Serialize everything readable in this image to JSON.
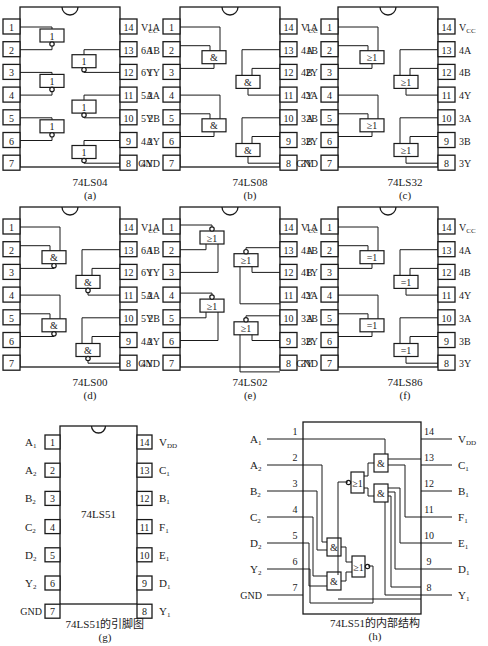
{
  "chips": [
    {
      "id": "a",
      "name": "74LS04",
      "caption": "(a)",
      "gate_type": "NOT",
      "gate_symbol": "1",
      "left_pins": [
        {
          "num": "1",
          "label": "1A"
        },
        {
          "num": "2",
          "label": "1Y"
        },
        {
          "num": "3",
          "label": "2A"
        },
        {
          "num": "4",
          "label": "2Y"
        },
        {
          "num": "5",
          "label": "3A"
        },
        {
          "num": "6",
          "label": "3Y"
        },
        {
          "num": "7",
          "label": "GND"
        }
      ],
      "right_pins": [
        {
          "num": "14",
          "label": "VCC"
        },
        {
          "num": "13",
          "label": "6A"
        },
        {
          "num": "12",
          "label": "6Y"
        },
        {
          "num": "11",
          "label": "5A"
        },
        {
          "num": "10",
          "label": "5Y"
        },
        {
          "num": "9",
          "label": "4A"
        },
        {
          "num": "8",
          "label": "4Y"
        }
      ]
    },
    {
      "id": "b",
      "name": "74LS08",
      "caption": "(b)",
      "gate_type": "AND",
      "gate_symbol": "&",
      "left_pins": [
        {
          "num": "1",
          "label": "1A"
        },
        {
          "num": "2",
          "label": "1B"
        },
        {
          "num": "3",
          "label": "1Y"
        },
        {
          "num": "4",
          "label": "2A"
        },
        {
          "num": "5",
          "label": "2B"
        },
        {
          "num": "6",
          "label": "2Y"
        },
        {
          "num": "7",
          "label": "GND"
        }
      ],
      "right_pins": [
        {
          "num": "14",
          "label": "VCC"
        },
        {
          "num": "13",
          "label": "4A"
        },
        {
          "num": "12",
          "label": "4B"
        },
        {
          "num": "11",
          "label": "4Y"
        },
        {
          "num": "10",
          "label": "3A"
        },
        {
          "num": "9",
          "label": "3B"
        },
        {
          "num": "8",
          "label": "3Y"
        }
      ]
    },
    {
      "id": "c",
      "name": "74LS32",
      "caption": "(c)",
      "gate_type": "OR",
      "gate_symbol": "≥1",
      "left_pins": [
        {
          "num": "1",
          "label": "1A"
        },
        {
          "num": "2",
          "label": "1B"
        },
        {
          "num": "3",
          "label": "2Y"
        },
        {
          "num": "4",
          "label": "2A"
        },
        {
          "num": "5",
          "label": "2B"
        },
        {
          "num": "6",
          "label": "2Y"
        },
        {
          "num": "7",
          "label": "GND"
        }
      ],
      "right_pins": [
        {
          "num": "14",
          "label": "VCC"
        },
        {
          "num": "13",
          "label": "4A"
        },
        {
          "num": "12",
          "label": "4B"
        },
        {
          "num": "11",
          "label": "4Y"
        },
        {
          "num": "10",
          "label": "3A"
        },
        {
          "num": "9",
          "label": "3B"
        },
        {
          "num": "8",
          "label": "3Y"
        }
      ]
    },
    {
      "id": "d",
      "name": "74LS00",
      "caption": "(d)",
      "gate_type": "NAND",
      "gate_symbol": "&",
      "left_pins": [
        {
          "num": "1",
          "label": "1A"
        },
        {
          "num": "2",
          "label": "1Y"
        },
        {
          "num": "3",
          "label": "2A"
        },
        {
          "num": "4",
          "label": "2Y"
        },
        {
          "num": "5",
          "label": "3A"
        },
        {
          "num": "6",
          "label": "3Y"
        },
        {
          "num": "7",
          "label": "GND"
        }
      ],
      "right_pins": [
        {
          "num": "14",
          "label": "VCC"
        },
        {
          "num": "13",
          "label": "6A"
        },
        {
          "num": "12",
          "label": "6Y"
        },
        {
          "num": "11",
          "label": "5A"
        },
        {
          "num": "10",
          "label": "5Y"
        },
        {
          "num": "9",
          "label": "4A"
        },
        {
          "num": "8",
          "label": "4Y"
        }
      ]
    },
    {
      "id": "e",
      "name": "74LS02",
      "caption": "(e)",
      "gate_type": "NOR",
      "gate_symbol": "≥1",
      "left_pins": [
        {
          "num": "1",
          "label": "1A"
        },
        {
          "num": "2",
          "label": "1B"
        },
        {
          "num": "3",
          "label": "1Y"
        },
        {
          "num": "4",
          "label": "2A"
        },
        {
          "num": "5",
          "label": "2B"
        },
        {
          "num": "6",
          "label": "2Y"
        },
        {
          "num": "7",
          "label": "GND"
        }
      ],
      "right_pins": [
        {
          "num": "14",
          "label": "VCC"
        },
        {
          "num": "13",
          "label": "4A"
        },
        {
          "num": "12",
          "label": "4B"
        },
        {
          "num": "11",
          "label": "4Y"
        },
        {
          "num": "10",
          "label": "3A"
        },
        {
          "num": "9",
          "label": "3B"
        },
        {
          "num": "8",
          "label": "3Y"
        }
      ]
    },
    {
      "id": "f",
      "name": "74LS86",
      "caption": "(f)",
      "gate_type": "XOR",
      "gate_symbol": "=1",
      "left_pins": [
        {
          "num": "1",
          "label": "1A"
        },
        {
          "num": "2",
          "label": "1B"
        },
        {
          "num": "3",
          "label": "1Y"
        },
        {
          "num": "4",
          "label": "2A"
        },
        {
          "num": "5",
          "label": "2B"
        },
        {
          "num": "6",
          "label": "2Y"
        },
        {
          "num": "7",
          "label": "GND"
        }
      ],
      "right_pins": [
        {
          "num": "14",
          "label": "VCC"
        },
        {
          "num": "13",
          "label": "4A"
        },
        {
          "num": "12",
          "label": "4B"
        },
        {
          "num": "11",
          "label": "4Y"
        },
        {
          "num": "10",
          "label": "3A"
        },
        {
          "num": "9",
          "label": "3B"
        },
        {
          "num": "8",
          "label": "3Y"
        }
      ]
    }
  ],
  "pinout_51": {
    "name": "74LS51",
    "title": "74LS51的引脚图",
    "caption": "(g)",
    "left_pins": [
      {
        "num": "1",
        "label": "A",
        "sub": "1"
      },
      {
        "num": "2",
        "label": "A",
        "sub": "2"
      },
      {
        "num": "3",
        "label": "B",
        "sub": "2"
      },
      {
        "num": "4",
        "label": "C",
        "sub": "2"
      },
      {
        "num": "5",
        "label": "D",
        "sub": "2"
      },
      {
        "num": "6",
        "label": "Y",
        "sub": "2"
      },
      {
        "num": "7",
        "label": "GND",
        "sub": ""
      }
    ],
    "right_pins": [
      {
        "num": "14",
        "label": "V",
        "sub": "DD"
      },
      {
        "num": "13",
        "label": "C",
        "sub": "1"
      },
      {
        "num": "12",
        "label": "B",
        "sub": "1"
      },
      {
        "num": "11",
        "label": "F",
        "sub": "1"
      },
      {
        "num": "10",
        "label": "E",
        "sub": "1"
      },
      {
        "num": "9",
        "label": "D",
        "sub": "1"
      },
      {
        "num": "8",
        "label": "Y",
        "sub": "1"
      }
    ]
  },
  "internal_51": {
    "title": "74LS51的内部结构",
    "caption": "(h)",
    "left_pins": [
      {
        "num": "1",
        "label": "A",
        "sub": "1"
      },
      {
        "num": "2",
        "label": "A",
        "sub": "2"
      },
      {
        "num": "3",
        "label": "B",
        "sub": "2"
      },
      {
        "num": "4",
        "label": "C",
        "sub": "2"
      },
      {
        "num": "5",
        "label": "D",
        "sub": "2"
      },
      {
        "num": "6",
        "label": "Y",
        "sub": "2"
      },
      {
        "num": "7",
        "label": "GND",
        "sub": ""
      }
    ],
    "right_pins": [
      {
        "num": "14",
        "label": "V",
        "sub": "DD"
      },
      {
        "num": "13",
        "label": "C",
        "sub": "1"
      },
      {
        "num": "12",
        "label": "B",
        "sub": "1"
      },
      {
        "num": "11",
        "label": "F",
        "sub": "1"
      },
      {
        "num": "10",
        "label": "E",
        "sub": "1"
      },
      {
        "num": "9",
        "label": "D",
        "sub": "1"
      },
      {
        "num": "8",
        "label": "Y",
        "sub": "1"
      }
    ],
    "gates": {
      "and": "&",
      "nor": "≥1"
    }
  }
}
